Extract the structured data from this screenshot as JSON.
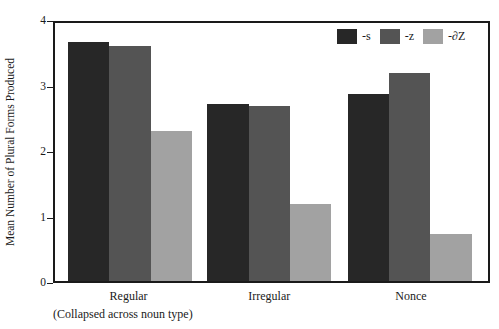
{
  "chart_data": {
    "type": "bar",
    "title": "",
    "xlabel": "(Collapsed across noun type)",
    "ylabel": "Mean Number of  Plural Forms Produced",
    "categories": [
      "Regular",
      "Irregular",
      "Nonce"
    ],
    "series": [
      {
        "name": "-s",
        "values": [
          3.7,
          2.74,
          2.9
        ],
        "color": "#272727"
      },
      {
        "name": "-z",
        "values": [
          3.65,
          2.71,
          3.22
        ],
        "color": "#545454"
      },
      {
        "name": "-∂Z",
        "values": [
          2.32,
          1.19,
          0.73
        ],
        "color": "#a2a2a2"
      }
    ],
    "ylim": [
      0,
      4
    ],
    "yticks": [
      0,
      1,
      2,
      3,
      4
    ],
    "ytick_labels": [
      "0",
      "1",
      "2",
      "3",
      "4"
    ],
    "grid": false,
    "legend_position": "top-right",
    "axis_color": "#1a1a1a"
  },
  "legend": {
    "items": [
      {
        "label": "-s",
        "color": "#272727"
      },
      {
        "label": "-z",
        "color": "#545454"
      },
      {
        "label": "-∂Z",
        "color": "#a2a2a2"
      }
    ]
  },
  "axes": {
    "y_title": "Mean Number of  Plural Forms Produced",
    "x_sub_note": "(Collapsed across noun type)"
  }
}
